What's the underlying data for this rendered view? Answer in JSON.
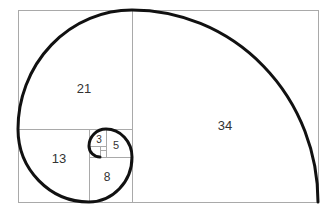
{
  "diagram": {
    "title": "",
    "type": "fibonacci-golden-spiral",
    "colors": {
      "grid": "#a9a9a9",
      "spiral": "#111111",
      "text": "#333333",
      "background": "#ffffff"
    },
    "squares": [
      {
        "id": "sq34",
        "label": "34"
      },
      {
        "id": "sq21",
        "label": "21"
      },
      {
        "id": "sq13",
        "label": "13"
      },
      {
        "id": "sq8",
        "label": "8"
      },
      {
        "id": "sq5",
        "label": "5"
      },
      {
        "id": "sq3",
        "label": "3"
      }
    ]
  }
}
